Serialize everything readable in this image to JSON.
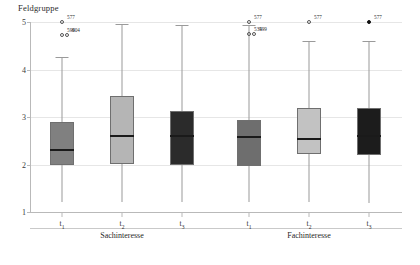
{
  "chart_data": {
    "type": "box",
    "title": "Feldgruppe",
    "xlabel": "",
    "ylabel": "",
    "ylim": [
      1,
      5
    ],
    "yticks": [
      1,
      2,
      3,
      4,
      5
    ],
    "ytick_labels": [
      "1",
      "2",
      "3",
      "4",
      "5"
    ],
    "grid": true,
    "legend": "none",
    "panels": [
      {
        "name": "Sachinteresse",
        "categories": [
          "t1",
          "t2",
          "t3"
        ]
      },
      {
        "name": "Fachinteresse",
        "categories": [
          "t1",
          "t2",
          "t3"
        ]
      }
    ],
    "boxes": [
      {
        "id": "box-sach-t1",
        "panel": "Sachinteresse",
        "category": "t1",
        "category_label": "t",
        "category_sub": "1",
        "color": "#808080",
        "whisker_low": 1.22,
        "q1": 2.0,
        "median": 2.32,
        "q3": 2.9,
        "whisker_high": 4.27,
        "outliers": [
          {
            "value": 5.0,
            "label": "577",
            "filled": false
          },
          {
            "value": 4.72,
            "label": "599",
            "filled": false
          },
          {
            "value": 4.72,
            "label": "604",
            "filled": false
          }
        ]
      },
      {
        "id": "box-sach-t2",
        "panel": "Sachinteresse",
        "category": "t2",
        "category_label": "t",
        "category_sub": "2",
        "color": "#b5b5b5",
        "whisker_low": 1.2,
        "q1": 2.02,
        "median": 2.62,
        "q3": 3.45,
        "whisker_high": 4.96,
        "outliers": []
      },
      {
        "id": "box-sach-t3",
        "panel": "Sachinteresse",
        "category": "t3",
        "category_label": "t",
        "category_sub": "3",
        "color": "#2b2b2b",
        "whisker_low": 1.22,
        "q1": 1.98,
        "median": 2.62,
        "q3": 3.12,
        "whisker_high": 4.93,
        "outliers": []
      },
      {
        "id": "box-fach-t1",
        "panel": "Fachinteresse",
        "category": "t1",
        "category_label": "t",
        "category_sub": "1",
        "color": "#6e6e6e",
        "whisker_low": 1.2,
        "q1": 1.96,
        "median": 2.6,
        "q3": 2.94,
        "whisker_high": 4.93,
        "outliers": [
          {
            "value": 5.0,
            "label": "577",
            "filled": false
          },
          {
            "value": 4.74,
            "label": "534",
            "filled": false
          },
          {
            "value": 4.74,
            "label": "599",
            "filled": false
          }
        ]
      },
      {
        "id": "box-fach-t2",
        "panel": "Fachinteresse",
        "category": "t2",
        "category_label": "t",
        "category_sub": "2",
        "color": "#c2c2c2",
        "whisker_low": 1.2,
        "q1": 2.22,
        "median": 2.56,
        "q3": 3.2,
        "whisker_high": 4.6,
        "outliers": [
          {
            "value": 5.0,
            "label": "577",
            "filled": false
          }
        ]
      },
      {
        "id": "box-fach-t3",
        "panel": "Fachinteresse",
        "category": "t3",
        "category_label": "t",
        "category_sub": "3",
        "color": "#1c1c1c",
        "whisker_low": 1.2,
        "q1": 2.2,
        "median": 2.62,
        "q3": 3.2,
        "whisker_high": 4.6,
        "outliers": [
          {
            "value": 5.0,
            "label": "577",
            "filled": true
          }
        ]
      }
    ]
  }
}
